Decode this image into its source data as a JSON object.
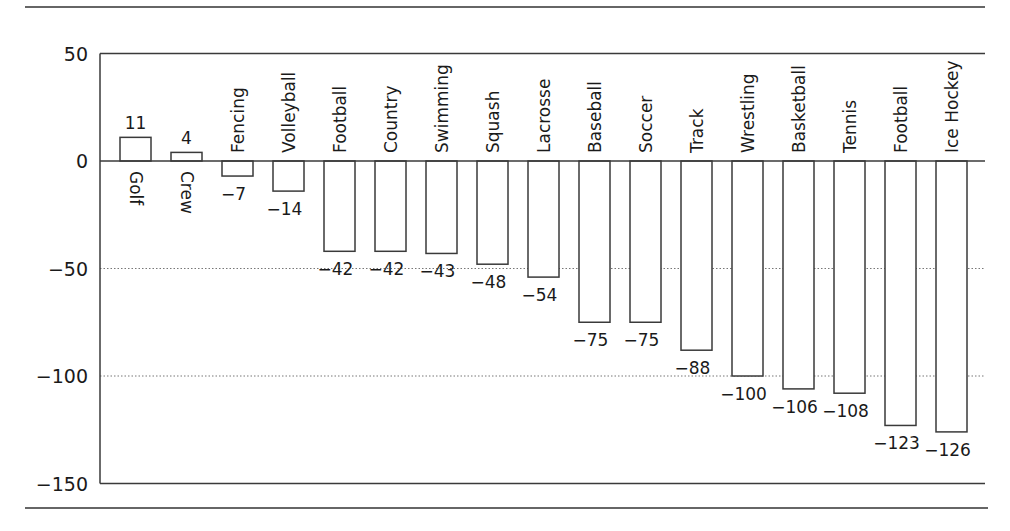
{
  "chart_data": {
    "type": "bar",
    "title": "",
    "xlabel": "",
    "ylabel": "",
    "ylim": [
      -150,
      50
    ],
    "yticks": [
      50,
      0,
      -50,
      -100,
      -150
    ],
    "grid": {
      "y": [
        -50,
        -100
      ],
      "style": "dotted"
    },
    "legend": null,
    "categories": [
      "Golf",
      "Crew",
      "Fencing",
      "Volleyball",
      "Football",
      "Country",
      "Swimming",
      "Squash",
      "Lacrosse",
      "Baseball",
      "Soccer",
      "Track",
      "Wrestling",
      "Basketball",
      "Tennis",
      "Football",
      "Ice Hockey"
    ],
    "values": [
      11,
      4,
      -7,
      -14,
      -42,
      -42,
      -43,
      -48,
      -54,
      -75,
      -75,
      -88,
      -100,
      -106,
      -108,
      -123,
      -126
    ],
    "value_labels": [
      "11",
      "4",
      "−7",
      "−14",
      "−42",
      "−42",
      "−43",
      "−48",
      "−54",
      "−75",
      "−75",
      "−88",
      "−100",
      "−106",
      "−108",
      "−123",
      "−126"
    ],
    "tick_labels": [
      "50",
      "0",
      "−50",
      "−100",
      "−150"
    ],
    "colors": {
      "bar_fill": "#ffffff",
      "bar_stroke": "#3a3a3a",
      "axis": "#3a3a3a",
      "grid": "#777777",
      "text": "#1a1a1a"
    }
  }
}
